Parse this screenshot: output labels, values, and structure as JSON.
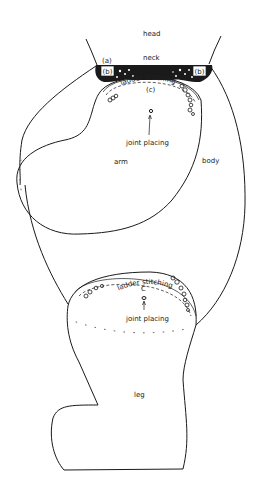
{
  "diagram": {
    "labels": {
      "head": "head",
      "neck": "neck",
      "a": "(a)",
      "b_left": "(b)",
      "b_right": "(b)",
      "ladder_upper": "ladder stitching",
      "c_upper": "(c)",
      "joint_upper": "joint placing",
      "arm": "arm",
      "body": "body",
      "ladder_lower": "ladder stitching",
      "c_lower": "C",
      "joint_lower": "joint placing",
      "leg": "leg"
    },
    "colors": {
      "ink": "#1a1a1a",
      "background": "#ffffff"
    }
  }
}
